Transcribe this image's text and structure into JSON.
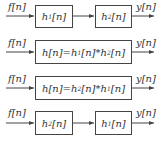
{
  "diagram": {
    "rows": [
      {
        "input": "f[n]",
        "output": "y[n]",
        "blocks": [
          {
            "name": "h",
            "sub": "1",
            "arg": "[n]"
          },
          {
            "name": "h",
            "sub": "2",
            "arg": "[n]"
          }
        ]
      },
      {
        "input": "f[n]",
        "output": "y[n]",
        "blocks": [
          {
            "pre": "h[n]=h",
            "sub1": "1",
            "mid": "[n]*h",
            "sub2": "2",
            "post": "[n]"
          }
        ]
      },
      {
        "input": "f[n]",
        "output": "y[n]",
        "blocks": [
          {
            "pre": "h[n]=h",
            "sub1": "2",
            "mid": "[n]*h",
            "sub2": "1",
            "post": "[n]"
          }
        ]
      },
      {
        "input": "f[n]",
        "output": "y[n]",
        "blocks": [
          {
            "name": "h",
            "sub": "2",
            "arg": "[n]"
          },
          {
            "name": "h",
            "sub": "1",
            "arg": "[n]"
          }
        ]
      }
    ],
    "colors": {
      "line": "#444444",
      "text": "#333333",
      "background": "#ffffff"
    }
  }
}
